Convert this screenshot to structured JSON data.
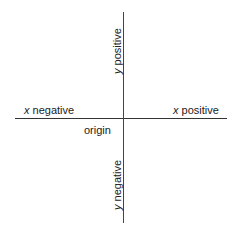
{
  "diagram": {
    "type": "cartesian-axes",
    "labels": {
      "x_positive": {
        "var": "x",
        "word": "positive"
      },
      "x_negative": {
        "var": "x",
        "word": "negative"
      },
      "y_positive": {
        "var": "y",
        "word": "positive"
      },
      "y_negative": {
        "var": "y",
        "word": "negative"
      },
      "origin": "origin"
    }
  }
}
